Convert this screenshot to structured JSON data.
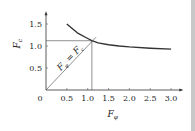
{
  "chart_data": {
    "type": "line",
    "title": "",
    "xlabel": "F_φ",
    "ylabel": "F_c",
    "xlim": [
      0,
      3.15
    ],
    "ylim": [
      0,
      1.7
    ],
    "x_ticks": [
      0.5,
      1.0,
      1.5,
      2.0,
      2.5,
      3.0
    ],
    "x_tick_labels": [
      "0.5",
      "1.0",
      "1.5",
      "2.0",
      "2.5",
      "3.0"
    ],
    "origin_label": "0",
    "y_ticks": [
      0.5,
      1.0,
      1.5
    ],
    "y_tick_labels": [
      "0.5",
      "1.0",
      "1.5"
    ],
    "series": [
      {
        "name": "F_c curve",
        "x": [
          0.5,
          0.75,
          1.0,
          1.1,
          1.25,
          1.5,
          1.75,
          2.0,
          2.5,
          3.0
        ],
        "y": [
          1.5,
          1.3,
          1.17,
          1.12,
          1.07,
          1.03,
          1.0,
          0.98,
          0.95,
          0.93
        ]
      },
      {
        "name": "F_φ = F_c",
        "x": [
          0,
          1.2
        ],
        "y": [
          0,
          1.2
        ]
      }
    ],
    "annotations": [
      {
        "text": "F_φ = F_c",
        "along": "diagonal"
      }
    ],
    "intersection": {
      "x": 1.1,
      "y": 1.12
    },
    "grid": false,
    "legend": "none"
  }
}
